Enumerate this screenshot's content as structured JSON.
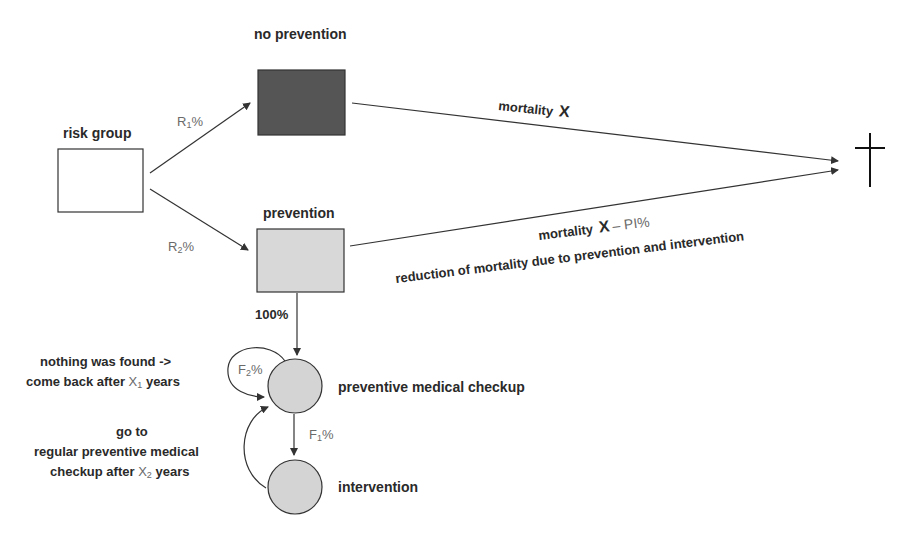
{
  "nodes": {
    "risk_group": {
      "label": "risk group",
      "fill": "#ffffff"
    },
    "no_prevention": {
      "label": "no prevention",
      "fill": "#555555"
    },
    "prevention": {
      "label": "prevention",
      "fill": "#d8d8d8"
    },
    "checkup": {
      "label": "preventive medical checkup",
      "fill": "#d4d4d4"
    },
    "intervention": {
      "label": "intervention",
      "fill": "#d4d4d4"
    },
    "death": {
      "label": "death-cross"
    }
  },
  "edges": {
    "r1": {
      "base": "R",
      "sub": "1",
      "suffix": "%"
    },
    "r2": {
      "base": "R",
      "sub": "2",
      "suffix": "%"
    },
    "mortality_x": {
      "text": "mortality",
      "var": "X"
    },
    "mortality_pi": {
      "text": "mortality",
      "var": "X",
      "minus": "– PI%"
    },
    "reduction": {
      "text": "reduction of mortality due to prevention and intervention"
    },
    "hundred": {
      "text": "100%"
    },
    "f1": {
      "base": "F",
      "sub": "1",
      "suffix": "%"
    },
    "f2": {
      "base": "F",
      "sub": "2",
      "suffix": "%"
    }
  },
  "annotations": {
    "nothing_found": {
      "line1": "nothing was found ->",
      "line2_a": "come back after ",
      "line2_var": "X",
      "line2_sub": "1",
      "line2_b": " years"
    },
    "go_to": {
      "line1": "go to",
      "line2": "regular preventive medical",
      "line3_a": "checkup after ",
      "line3_var": "X",
      "line3_sub": "2",
      "line3_b": " years"
    }
  }
}
